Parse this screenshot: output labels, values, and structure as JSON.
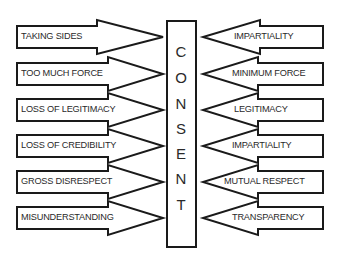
{
  "diagram": {
    "center_label": "CONSENT",
    "center_letters": [
      "C",
      "O",
      "N",
      "S",
      "E",
      "N",
      "T"
    ],
    "left_arrows": [
      {
        "label": "TAKING SIDES",
        "direction": "right"
      },
      {
        "label": "TOO MUCH FORCE",
        "direction": "right"
      },
      {
        "label": "LOSS OF LEGITIMACY",
        "direction": "right"
      },
      {
        "label": "LOSS OF CREDIBILITY",
        "direction": "right"
      },
      {
        "label": "GROSS DISRESPECT",
        "direction": "right"
      },
      {
        "label": "MISUNDERSTANDING",
        "direction": "right"
      }
    ],
    "right_arrows": [
      {
        "label": "IMPARTIALITY",
        "direction": "left"
      },
      {
        "label": "MINIMUM FORCE",
        "direction": "left"
      },
      {
        "label": "LEGITIMACY",
        "direction": "left"
      },
      {
        "label": "IMPARTIALITY",
        "direction": "left"
      },
      {
        "label": "MUTUAL RESPECT",
        "direction": "left"
      },
      {
        "label": "TRANSPARENCY",
        "direction": "left"
      }
    ],
    "colors": {
      "stroke": "#1a1a1a",
      "fill": "#ffffff",
      "text": "#2a2a2a"
    }
  }
}
